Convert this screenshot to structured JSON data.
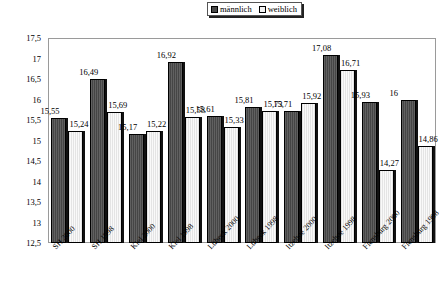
{
  "legend": {
    "position": "top-center",
    "entries": [
      {
        "label": "männlich",
        "key": "male",
        "color": "#4d4d4d"
      },
      {
        "label": "weiblich",
        "key": "female",
        "color": "#f0f0f0"
      }
    ]
  },
  "axis": {
    "y_ticks": [
      "17,5",
      "17",
      "16,5",
      "16",
      "15,5",
      "15",
      "14,5",
      "14",
      "13,5",
      "13",
      "12,5"
    ]
  },
  "chart_data": {
    "type": "bar",
    "title": "",
    "xlabel": "",
    "ylabel": "",
    "ylim": [
      12.5,
      17.5
    ],
    "ytick_step": 0.5,
    "grid": false,
    "legend_position": "top-center",
    "categories": [
      "SH 2000",
      "SH 1998",
      "Kiel 2000",
      "Kiel 1998",
      "Lübeck 2000",
      "Lübeck 1998",
      "Itzehoe 2000",
      "Itzehoe 1998",
      "Flensburg 2000",
      "Flensburg 1998"
    ],
    "series": [
      {
        "name": "männlich",
        "color": "#4d4d4d",
        "values": [
          15.55,
          16.49,
          15.17,
          16.92,
          15.61,
          15.81,
          15.71,
          17.08,
          15.93,
          16
        ],
        "labels": [
          "15,55",
          "16,49",
          "15,17",
          "16,92",
          "15,61",
          "15,81",
          "15,71",
          "17,08",
          "15,93",
          "16"
        ]
      },
      {
        "name": "weiblich",
        "color": "#f0f0f0",
        "values": [
          15.24,
          15.69,
          15.22,
          15.58,
          15.33,
          15.73,
          15.92,
          16.71,
          14.27,
          14.86
        ],
        "labels": [
          "15,24",
          "15,69",
          "15,22",
          "15,58",
          "15,33",
          "15,73",
          "15,92",
          "16,71",
          "14,27",
          "14,86"
        ]
      }
    ]
  }
}
